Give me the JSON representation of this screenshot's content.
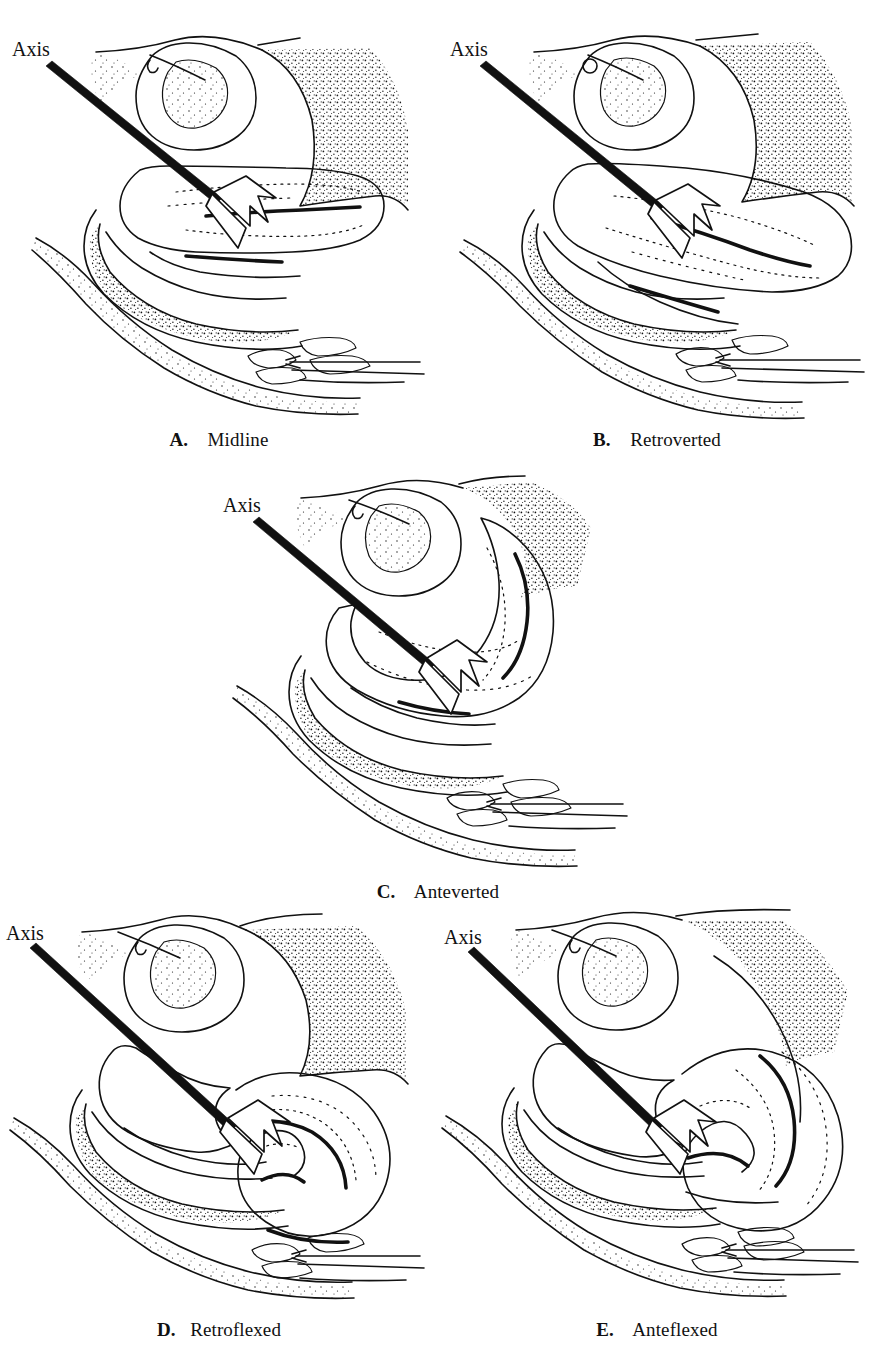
{
  "figure": {
    "type": "medical-line-illustration",
    "background_color": "#ffffff",
    "ink_color": "#111111",
    "panel_count": 5,
    "axis_label_text": "Axis"
  },
  "panels": [
    {
      "id": "A",
      "letter": "A.",
      "name": "Midline",
      "caption": "A.  Midline",
      "axis_label": "Axis",
      "description": "Uterus lying in the midline axis of the pelvis; body and cervix nearly straight.",
      "grid_position": {
        "row": 1,
        "column": 1
      }
    },
    {
      "id": "B",
      "letter": "B.",
      "name": "Retroverted",
      "caption": "B.  Retroverted",
      "axis_label": "Axis",
      "description": "Whole uterus tilted backward toward the rectum; cervix angled forward.",
      "grid_position": {
        "row": 1,
        "column": 2
      }
    },
    {
      "id": "C",
      "letter": "C.",
      "name": "Anteverted",
      "caption": "C.  Anteverted",
      "axis_label": "Axis",
      "description": "Whole uterus tilted forward over the bladder.",
      "grid_position": {
        "row": 2,
        "column": 1
      }
    },
    {
      "id": "D",
      "letter": "D.",
      "name": "Retroflexed",
      "caption": "D.  Retroflexed",
      "axis_label": "Axis",
      "description": "Uterine body bent backward on the cervix, forming a posterior angle.",
      "grid_position": {
        "row": 3,
        "column": 1
      }
    },
    {
      "id": "E",
      "letter": "E.",
      "name": "Anteflexed",
      "caption": "E.  Anteflexed",
      "axis_label": "Axis",
      "description": "Uterine body bent forward on the cervix, forming an anterior angle.",
      "grid_position": {
        "row": 3,
        "column": 2
      }
    }
  ]
}
